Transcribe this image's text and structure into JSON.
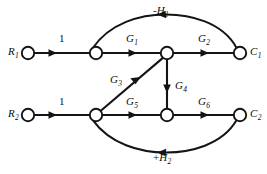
{
  "figure": {
    "background_color": "#ffffff",
    "line_color": "#141414",
    "node_fill": "#ffffff",
    "width": 267,
    "height": 174
  },
  "nodes": [
    {
      "id": "R1",
      "label": "R",
      "sub": "1",
      "x": 28,
      "y": 53,
      "r": 6.2,
      "label_side": "left"
    },
    {
      "id": "n1",
      "label": "",
      "sub": "",
      "x": 96,
      "y": 53,
      "r": 6.2,
      "label_side": "none"
    },
    {
      "id": "n2",
      "label": "",
      "sub": "",
      "x": 167,
      "y": 53,
      "r": 6.2,
      "label_side": "none"
    },
    {
      "id": "C1",
      "label": "C",
      "sub": "1",
      "x": 240,
      "y": 53,
      "r": 6.2,
      "label_side": "right"
    },
    {
      "id": "R2",
      "label": "R",
      "sub": "2",
      "x": 28,
      "y": 115,
      "r": 6.2,
      "label_side": "left"
    },
    {
      "id": "n3",
      "label": "",
      "sub": "",
      "x": 96,
      "y": 115,
      "r": 6.2,
      "label_side": "none"
    },
    {
      "id": "n4",
      "label": "",
      "sub": "",
      "x": 167,
      "y": 115,
      "r": 6.2,
      "label_side": "none"
    },
    {
      "id": "C2",
      "label": "C",
      "sub": "2",
      "x": 240,
      "y": 115,
      "r": 6.2,
      "label_side": "right"
    }
  ],
  "edges": [
    {
      "id": "e_r1_n1",
      "from": "R1",
      "to": "n1",
      "gain": "1",
      "gain_sub": "",
      "sign": "",
      "shape": "straight",
      "direction": "right"
    },
    {
      "id": "e_n1_n2",
      "from": "n1",
      "to": "n2",
      "gain": "G",
      "gain_sub": "1",
      "sign": "",
      "shape": "straight",
      "direction": "right"
    },
    {
      "id": "e_n2_c1",
      "from": "n2",
      "to": "C1",
      "gain": "G",
      "gain_sub": "2",
      "sign": "",
      "shape": "straight",
      "direction": "right"
    },
    {
      "id": "e_c1_n1",
      "from": "C1",
      "to": "n1",
      "gain": "H",
      "gain_sub": "1",
      "sign": "-",
      "shape": "arc-top",
      "direction": "left"
    },
    {
      "id": "e_r2_n3",
      "from": "R2",
      "to": "n3",
      "gain": "1",
      "gain_sub": "",
      "sign": "",
      "shape": "straight",
      "direction": "right"
    },
    {
      "id": "e_n3_n2",
      "from": "n3",
      "to": "n2",
      "gain": "G",
      "gain_sub": "3",
      "sign": "",
      "shape": "diagonal",
      "direction": "up-right"
    },
    {
      "id": "e_n2_n4",
      "from": "n2",
      "to": "n4",
      "gain": "G",
      "gain_sub": "4",
      "sign": "",
      "shape": "vertical",
      "direction": "down"
    },
    {
      "id": "e_n3_n4",
      "from": "n3",
      "to": "n4",
      "gain": "G",
      "gain_sub": "5",
      "sign": "",
      "shape": "straight",
      "direction": "right"
    },
    {
      "id": "e_n4_c2",
      "from": "n4",
      "to": "C2",
      "gain": "G",
      "gain_sub": "6",
      "sign": "",
      "shape": "straight",
      "direction": "right"
    },
    {
      "id": "e_c2_n3",
      "from": "C2",
      "to": "n3",
      "gain": "H",
      "gain_sub": "2",
      "sign": "+",
      "shape": "arc-bottom",
      "direction": "left"
    }
  ],
  "labels": {
    "node_R1": {
      "text": "R",
      "sub": "1",
      "x": 8,
      "y": 46
    },
    "node_C1": {
      "text": "C",
      "sub": "1",
      "x": 250,
      "y": 46
    },
    "node_R2": {
      "text": "R",
      "sub": "2",
      "x": 8,
      "y": 108
    },
    "node_C2": {
      "text": "C",
      "sub": "2",
      "x": 250,
      "y": 108
    },
    "gain_1_top": {
      "text": "1",
      "sub": "",
      "sign": "",
      "x": 59,
      "y": 33
    },
    "gain_G1": {
      "text": "G",
      "sub": "1",
      "sign": "",
      "x": 126,
      "y": 33
    },
    "gain_G2": {
      "text": "G",
      "sub": "2",
      "sign": "",
      "x": 198,
      "y": 33
    },
    "gain_minusH1": {
      "text": "H",
      "sub": "1",
      "sign": "-",
      "x": 153,
      "y": 5
    },
    "gain_1_bottom": {
      "text": "1",
      "sub": "",
      "sign": "",
      "x": 59,
      "y": 96
    },
    "gain_G3": {
      "text": "G",
      "sub": "3",
      "sign": "",
      "x": 110,
      "y": 74
    },
    "gain_G4": {
      "text": "G",
      "sub": "4",
      "sign": "",
      "x": 175,
      "y": 80
    },
    "gain_G5": {
      "text": "G",
      "sub": "5",
      "sign": "",
      "x": 126,
      "y": 96
    },
    "gain_G6": {
      "text": "G",
      "sub": "6",
      "sign": "",
      "x": 198,
      "y": 96
    },
    "gain_plusH2": {
      "text": "H",
      "sub": "2",
      "sign": "+",
      "x": 153,
      "y": 152
    }
  }
}
